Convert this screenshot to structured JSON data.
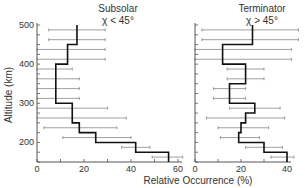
{
  "chart_data": [
    {
      "type": "line",
      "style": "step-histogram-with-errorbars",
      "title": "Subsolar",
      "subtitle": "χ < 45°",
      "xlabel": "Relative Occurrence (%)",
      "ylabel": "Altitude (km)",
      "xlim": [
        0,
        60
      ],
      "ylim": [
        150,
        500
      ],
      "xticks": [
        0,
        20,
        40,
        60
      ],
      "yticks": [
        200,
        300,
        400,
        500
      ],
      "bins": [
        {
          "alt_low": 150,
          "alt_high": 175,
          "value": 56,
          "err_low": 49,
          "err_high": 62
        },
        {
          "alt_low": 175,
          "alt_high": 200,
          "value": 42,
          "err_low": 36,
          "err_high": 48
        },
        {
          "alt_low": 200,
          "alt_high": 225,
          "value": 25,
          "err_low": 11,
          "err_high": 40
        },
        {
          "alt_low": 225,
          "alt_high": 250,
          "value": 18,
          "err_low": 3,
          "err_high": 34
        },
        {
          "alt_low": 250,
          "alt_high": 275,
          "value": 15,
          "err_low": 0,
          "err_high": 38
        },
        {
          "alt_low": 275,
          "alt_high": 300,
          "value": 15,
          "err_low": 0,
          "err_high": 30
        },
        {
          "alt_low": 300,
          "alt_high": 325,
          "value": 8,
          "err_low": 0,
          "err_high": 18
        },
        {
          "alt_low": 325,
          "alt_high": 350,
          "value": 8,
          "err_low": 0,
          "err_high": 18
        },
        {
          "alt_low": 350,
          "alt_high": 375,
          "value": 8,
          "err_low": 0,
          "err_high": 18
        },
        {
          "alt_low": 375,
          "alt_high": 400,
          "value": 8,
          "err_low": 0,
          "err_high": 15
        },
        {
          "alt_low": 400,
          "alt_high": 425,
          "value": 13,
          "err_low": 0,
          "err_high": 29
        },
        {
          "alt_low": 425,
          "alt_high": 450,
          "value": 13,
          "err_low": 0,
          "err_high": 29
        },
        {
          "alt_low": 450,
          "alt_high": 475,
          "value": 17,
          "err_low": 5,
          "err_high": 29
        },
        {
          "alt_low": 475,
          "alt_high": 500,
          "value": 17,
          "err_low": 5,
          "err_high": 29
        }
      ]
    },
    {
      "type": "line",
      "style": "step-histogram-with-errorbars",
      "title": "Terminator",
      "subtitle": "χ > 45°",
      "xlabel": "Relative Occurrence (%)",
      "ylabel": "Altitude (km)",
      "xlim": [
        0,
        40
      ],
      "ylim": [
        150,
        500
      ],
      "xticks": [
        0,
        20,
        40
      ],
      "yticks": [
        200,
        300,
        400,
        500
      ],
      "bins": [
        {
          "alt_low": 150,
          "alt_high": 175,
          "value": 40,
          "err_low": 33,
          "err_high": 43
        },
        {
          "alt_low": 175,
          "alt_high": 200,
          "value": 30,
          "err_low": 22,
          "err_high": 38
        },
        {
          "alt_low": 200,
          "alt_high": 225,
          "value": 19,
          "err_low": 11,
          "err_high": 28
        },
        {
          "alt_low": 225,
          "alt_high": 250,
          "value": 20,
          "err_low": 10,
          "err_high": 32
        },
        {
          "alt_low": 250,
          "alt_high": 275,
          "value": 22,
          "err_low": 5,
          "err_high": 39
        },
        {
          "alt_low": 275,
          "alt_high": 300,
          "value": 26,
          "err_low": 15,
          "err_high": 37
        },
        {
          "alt_low": 300,
          "alt_high": 325,
          "value": 15,
          "err_low": 8,
          "err_high": 22
        },
        {
          "alt_low": 325,
          "alt_high": 350,
          "value": 15,
          "err_low": 8,
          "err_high": 22
        },
        {
          "alt_low": 350,
          "alt_high": 375,
          "value": 22,
          "err_low": 14,
          "err_high": 30
        },
        {
          "alt_low": 375,
          "alt_high": 400,
          "value": 22,
          "err_low": 14,
          "err_high": 30
        },
        {
          "alt_low": 400,
          "alt_high": 425,
          "value": 12,
          "err_low": 0,
          "err_high": 42
        },
        {
          "alt_low": 425,
          "alt_high": 450,
          "value": 12,
          "err_low": 0,
          "err_high": 42
        },
        {
          "alt_low": 450,
          "alt_high": 475,
          "value": 25,
          "err_low": 3,
          "err_high": 45
        },
        {
          "alt_low": 475,
          "alt_high": 500,
          "value": 25,
          "err_low": 3,
          "err_high": 45
        }
      ]
    }
  ],
  "labels": {
    "ylabel": "Altitude (km)",
    "xlabel": "Relative Occurrence (%)",
    "left_title": "Subsolar",
    "left_subtitle": "χ < 45°",
    "right_title": "Terminator",
    "right_subtitle": "χ > 45°"
  }
}
